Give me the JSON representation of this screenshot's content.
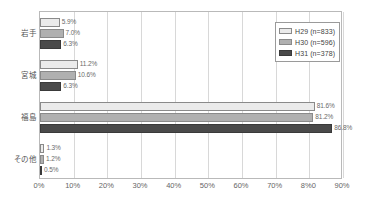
{
  "chart_data": {
    "type": "bar",
    "orientation": "horizontal",
    "title": "",
    "xlabel": "",
    "ylabel": "",
    "xlim": [
      0,
      90
    ],
    "xticks": [
      0,
      10,
      20,
      30,
      40,
      50,
      60,
      70,
      80,
      90
    ],
    "xtick_labels": [
      "0%",
      "10%",
      "20%",
      "30%",
      "40%",
      "50%",
      "60%",
      "70%",
      "8%0",
      "90%"
    ],
    "grid": true,
    "grid_axis": "x",
    "legend_position": "top-right",
    "categories": [
      "岩手",
      "宮城",
      "福島",
      "その他"
    ],
    "series": [
      {
        "name": "H29",
        "legend_label": "H29 (n=833)",
        "n": 833,
        "color": "#ebebeb",
        "values": [
          5.9,
          11.2,
          81.6,
          1.3
        ],
        "value_labels": [
          "5.9%",
          "11.2%",
          "81.6%",
          "1.3%"
        ]
      },
      {
        "name": "H30",
        "legend_label": "H30 (n=596)",
        "n": 596,
        "color": "#b0b0b0",
        "values": [
          7.0,
          10.6,
          81.2,
          1.2
        ],
        "value_labels": [
          "7.0%",
          "10.6%",
          "81.2%",
          "1.2%"
        ]
      },
      {
        "name": "H31",
        "legend_label": "H31 (n=378)",
        "n": 378,
        "color": "#4a4a4a",
        "values": [
          6.3,
          6.3,
          86.8,
          0.5
        ],
        "value_labels": [
          "6.3%",
          "6.3%",
          "86.8%",
          "0.5%"
        ]
      }
    ]
  },
  "legend": {
    "items": [
      {
        "label": "H29 (n=833)"
      },
      {
        "label": "H30 (n=596)"
      },
      {
        "label": "H31 (n=378)"
      }
    ]
  },
  "axis": {
    "tick_labels": [
      "0%",
      "10%",
      "20%",
      "30%",
      "40%",
      "50%",
      "60%",
      "70%",
      "8%0",
      "90%"
    ]
  },
  "categories": [
    {
      "label": "岩手"
    },
    {
      "label": "宮城"
    },
    {
      "label": "福島"
    },
    {
      "label": "その他"
    }
  ]
}
